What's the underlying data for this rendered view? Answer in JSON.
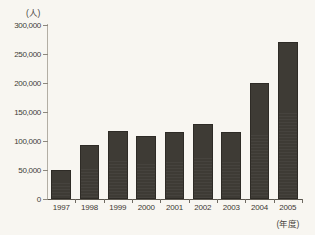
{
  "chart_data": {
    "type": "bar",
    "title": "",
    "subtitle": "",
    "xlabel": "(年度)",
    "ylabel": "(人)",
    "categories": [
      "1997",
      "1998",
      "1999",
      "2000",
      "2001",
      "2002",
      "2003",
      "2004",
      "2005"
    ],
    "values": [
      50000,
      93000,
      118000,
      109000,
      116000,
      129000,
      116000,
      200000,
      271000
    ],
    "series": [
      {
        "name": "人数",
        "values": [
          50000,
          93000,
          118000,
          109000,
          116000,
          129000,
          116000,
          200000,
          271000
        ]
      }
    ],
    "ylim": [
      0,
      300000
    ],
    "ytick_values": [
      0,
      50000,
      100000,
      150000,
      200000,
      250000,
      300000
    ],
    "ytick_labels": [
      "0",
      "50,000",
      "100,000",
      "150,000",
      "200,000",
      "250,000",
      "300,000"
    ],
    "grid": false,
    "legend": null,
    "legend_position": "none",
    "annotations": [],
    "bar_color": "#3e3b35",
    "background_color": "#f8f6f1",
    "axis_color": "#5a564e",
    "text_color": "#3d3933"
  },
  "axes": {
    "y_unit_caption": "(人)",
    "x_unit_caption": "(年度)"
  }
}
